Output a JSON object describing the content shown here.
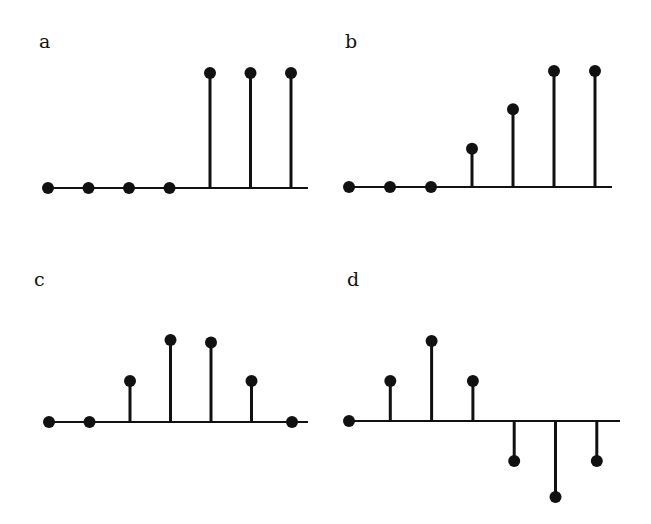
{
  "chart_data": [
    {
      "type": "stem",
      "label": "a",
      "title": "",
      "xlabel": "",
      "ylabel": "",
      "grid": false,
      "x": [
        0,
        1,
        2,
        3,
        4,
        5,
        6
      ],
      "values": [
        0,
        0,
        0,
        0,
        1,
        1,
        1
      ],
      "ylim": [
        0,
        1
      ],
      "layout": {
        "label_x": 39,
        "label_y": 30,
        "x0": 48,
        "dx": 40.5,
        "baseline_y": 188,
        "unit_px": 115,
        "axis_end_x": 308
      }
    },
    {
      "type": "stem",
      "label": "b",
      "title": "",
      "xlabel": "",
      "ylabel": "",
      "grid": false,
      "x": [
        0,
        1,
        2,
        3,
        4,
        5,
        6
      ],
      "values": [
        0,
        0,
        0,
        0.33,
        0.67,
        1,
        1
      ],
      "ylim": [
        0,
        1
      ],
      "layout": {
        "label_x": 345,
        "label_y": 30,
        "x0": 349,
        "dx": 41,
        "baseline_y": 187,
        "unit_px": 116,
        "axis_end_x": 612
      }
    },
    {
      "type": "stem",
      "label": "c",
      "title": "",
      "xlabel": "",
      "ylabel": "",
      "grid": false,
      "x": [
        0,
        1,
        2,
        3,
        4,
        5,
        6
      ],
      "values": [
        0,
        0,
        0.5,
        1,
        0.97,
        0.5,
        0
      ],
      "ylim": [
        0,
        1
      ],
      "layout": {
        "label_x": 34,
        "label_y": 268,
        "x0": 49,
        "dx": 40.5,
        "baseline_y": 422,
        "unit_px": 82,
        "axis_end_x": 308
      }
    },
    {
      "type": "stem",
      "label": "d",
      "title": "",
      "xlabel": "",
      "ylabel": "",
      "grid": false,
      "x": [
        0,
        1,
        2,
        3,
        4,
        5,
        6
      ],
      "values": [
        0,
        0.5,
        1,
        0.5,
        -0.5,
        -0.95,
        -0.5
      ],
      "ylim": [
        -1,
        1
      ],
      "layout": {
        "label_x": 347,
        "label_y": 268,
        "x0": 349,
        "dx": 41.3,
        "baseline_y": 421,
        "unit_px": 80,
        "axis_end_x": 620
      }
    }
  ],
  "style": {
    "ink_color": "#111111",
    "background": "#ffffff"
  }
}
